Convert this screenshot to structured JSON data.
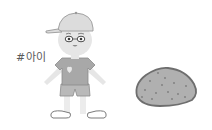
{
  "illustration": {
    "tag_text": "#아이",
    "subjects": [
      "child",
      "stone"
    ],
    "colors": {
      "background": "#ffffff",
      "skin": "#e6e6e6",
      "cap": "#dcdcdc",
      "cap_outline": "#9a9a9a",
      "shirt": "#a8a8a8",
      "shorts": "#b9b9b9",
      "stone_fill": "#b0b0b0",
      "stone_outline": "#6e6e6e",
      "stone_dots": "#7c7c7c",
      "outline": "#7a7a7a",
      "text": "#5a5a5a"
    }
  }
}
